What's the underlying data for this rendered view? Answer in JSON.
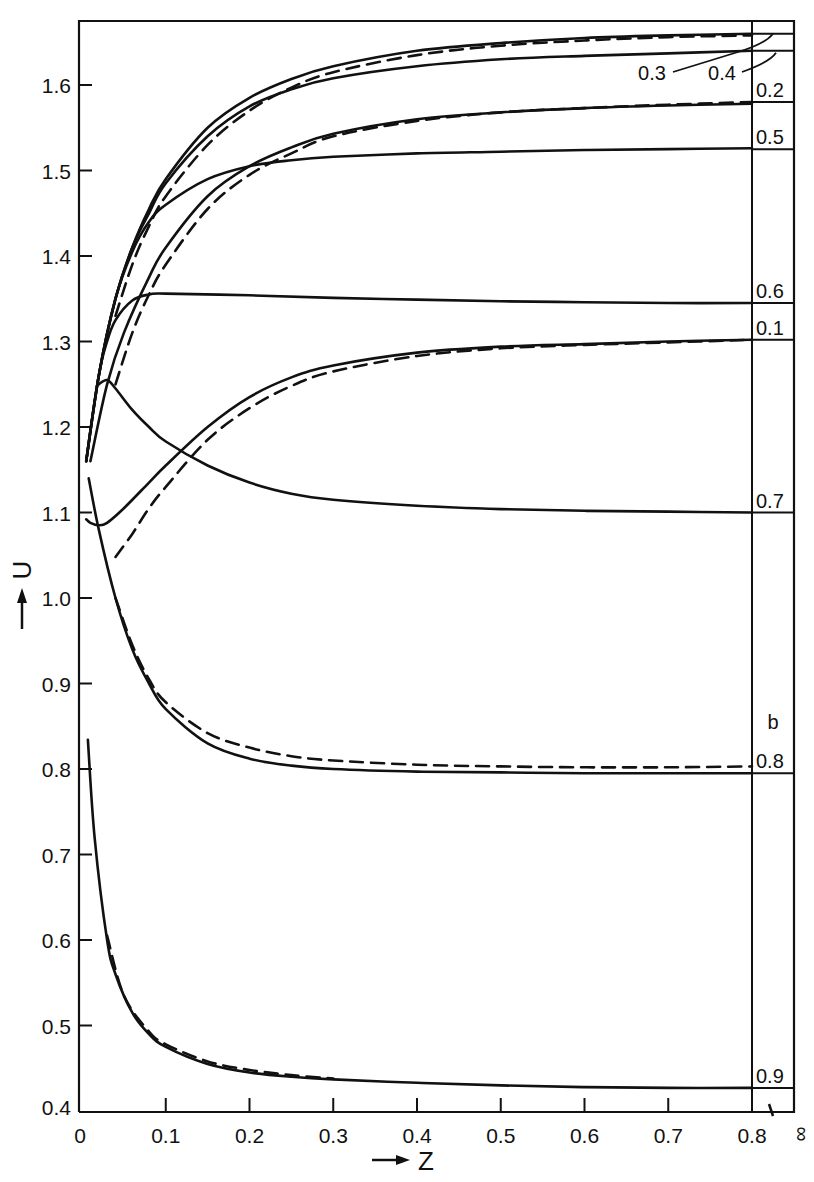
{
  "chart_data": {
    "type": "line",
    "title": "",
    "panel_label": "b",
    "xlabel": "Z",
    "ylabel": "U",
    "xlim": [
      0,
      0.8
    ],
    "ylim": [
      0.4,
      1.67
    ],
    "grid": false,
    "x_ticks": [
      "0",
      "0.1",
      "0.2",
      "0.3",
      "0.4",
      "0.5",
      "0.6",
      "0.7",
      "0.8"
    ],
    "x_extra_tick": "∞",
    "y_ticks": [
      "0.4",
      "0.5",
      "0.6",
      "0.7",
      "0.8",
      "0.9",
      "1.0",
      "1.1",
      "1.2",
      "1.3",
      "1.4",
      "1.5",
      "1.6"
    ],
    "legend": "Curves labeled by parameter at right margin; solid = exact, dashed = approximation; right strip gives asymptotic values at Z = ∞",
    "series": [
      {
        "name": "0.3",
        "style": "solid",
        "x": [
          0.005,
          0.02,
          0.04,
          0.06,
          0.08,
          0.1,
          0.15,
          0.2,
          0.25,
          0.3,
          0.4,
          0.5,
          0.6,
          0.7,
          0.8
        ],
        "y": [
          1.16,
          1.26,
          1.35,
          1.41,
          1.455,
          1.49,
          1.55,
          1.585,
          1.607,
          1.622,
          1.64,
          1.649,
          1.655,
          1.658,
          1.66
        ],
        "infinity_value": 1.66
      },
      {
        "name": "0.3",
        "style": "dashed",
        "x": [
          0.04,
          0.06,
          0.08,
          0.1,
          0.15,
          0.2,
          0.25,
          0.3,
          0.4,
          0.5,
          0.6,
          0.7,
          0.8
        ],
        "y": [
          1.33,
          1.39,
          1.435,
          1.47,
          1.53,
          1.57,
          1.597,
          1.615,
          1.635,
          1.646,
          1.652,
          1.656,
          1.658
        ]
      },
      {
        "name": "0.4",
        "style": "solid",
        "x": [
          0.005,
          0.02,
          0.04,
          0.06,
          0.08,
          0.1,
          0.15,
          0.2,
          0.25,
          0.3,
          0.4,
          0.5,
          0.6,
          0.7,
          0.8
        ],
        "y": [
          1.16,
          1.26,
          1.35,
          1.41,
          1.45,
          1.485,
          1.54,
          1.575,
          1.595,
          1.608,
          1.622,
          1.63,
          1.634,
          1.637,
          1.64
        ],
        "infinity_value": 1.64
      },
      {
        "name": "0.2",
        "style": "solid",
        "x": [
          0.01,
          0.03,
          0.05,
          0.08,
          0.1,
          0.15,
          0.2,
          0.25,
          0.3,
          0.4,
          0.5,
          0.6,
          0.7,
          0.8
        ],
        "y": [
          1.16,
          1.25,
          1.31,
          1.375,
          1.41,
          1.47,
          1.505,
          1.527,
          1.543,
          1.56,
          1.568,
          1.573,
          1.576,
          1.578
        ],
        "infinity_value": 1.58
      },
      {
        "name": "0.2",
        "style": "dashed",
        "x": [
          0.04,
          0.06,
          0.08,
          0.1,
          0.15,
          0.2,
          0.25,
          0.3,
          0.4,
          0.5,
          0.6,
          0.7,
          0.8
        ],
        "y": [
          1.25,
          1.31,
          1.355,
          1.39,
          1.455,
          1.495,
          1.52,
          1.54,
          1.558,
          1.568,
          1.573,
          1.577,
          1.58
        ]
      },
      {
        "name": "0.5",
        "style": "solid",
        "x": [
          0.005,
          0.02,
          0.04,
          0.06,
          0.08,
          0.1,
          0.15,
          0.2,
          0.25,
          0.3,
          0.4,
          0.5,
          0.6,
          0.7,
          0.8
        ],
        "y": [
          1.16,
          1.26,
          1.35,
          1.405,
          1.44,
          1.46,
          1.49,
          1.505,
          1.512,
          1.516,
          1.52,
          1.522,
          1.524,
          1.525,
          1.526
        ],
        "infinity_value": 1.525
      },
      {
        "name": "0.6",
        "style": "solid",
        "x": [
          0.005,
          0.02,
          0.03,
          0.04,
          0.06,
          0.08,
          0.1,
          0.2,
          0.3,
          0.4,
          0.5,
          0.6,
          0.7,
          0.8
        ],
        "y": [
          1.16,
          1.26,
          1.3,
          1.325,
          1.348,
          1.355,
          1.356,
          1.354,
          1.351,
          1.349,
          1.347,
          1.346,
          1.345,
          1.345
        ],
        "infinity_value": 1.345
      },
      {
        "name": "0.1",
        "style": "solid",
        "x": [
          0.005,
          0.01,
          0.02,
          0.03,
          0.05,
          0.08,
          0.1,
          0.15,
          0.2,
          0.25,
          0.3,
          0.4,
          0.5,
          0.6,
          0.7,
          0.8
        ],
        "y": [
          1.092,
          1.088,
          1.085,
          1.088,
          1.105,
          1.135,
          1.155,
          1.2,
          1.235,
          1.258,
          1.272,
          1.287,
          1.294,
          1.297,
          1.3,
          1.302
        ],
        "infinity_value": 1.302
      },
      {
        "name": "0.1",
        "style": "dashed",
        "x": [
          0.04,
          0.06,
          0.08,
          0.1,
          0.15,
          0.2,
          0.25,
          0.3,
          0.4,
          0.5,
          0.6,
          0.7,
          0.8
        ],
        "y": [
          1.048,
          1.075,
          1.105,
          1.13,
          1.185,
          1.222,
          1.248,
          1.265,
          1.283,
          1.292,
          1.296,
          1.299,
          1.302
        ]
      },
      {
        "name": "0.7",
        "style": "solid",
        "x": [
          0.02,
          0.03,
          0.04,
          0.06,
          0.08,
          0.1,
          0.15,
          0.2,
          0.25,
          0.3,
          0.4,
          0.5,
          0.6,
          0.7,
          0.8
        ],
        "y": [
          1.25,
          1.255,
          1.245,
          1.22,
          1.2,
          1.183,
          1.155,
          1.135,
          1.122,
          1.115,
          1.108,
          1.104,
          1.102,
          1.101,
          1.1
        ],
        "infinity_value": 1.1
      },
      {
        "name": "0.8",
        "style": "solid",
        "x": [
          0.008,
          0.02,
          0.04,
          0.06,
          0.08,
          0.1,
          0.15,
          0.2,
          0.25,
          0.3,
          0.4,
          0.5,
          0.6,
          0.7,
          0.8
        ],
        "y": [
          1.14,
          1.08,
          1.0,
          0.94,
          0.9,
          0.87,
          0.83,
          0.812,
          0.804,
          0.8,
          0.797,
          0.796,
          0.795,
          0.795,
          0.795
        ],
        "infinity_value": 0.795
      },
      {
        "name": "0.8",
        "style": "dashed",
        "x": [
          0.04,
          0.06,
          0.08,
          0.1,
          0.15,
          0.2,
          0.25,
          0.3,
          0.4,
          0.5,
          0.6,
          0.7,
          0.8
        ],
        "y": [
          1.0,
          0.945,
          0.905,
          0.878,
          0.842,
          0.825,
          0.815,
          0.81,
          0.805,
          0.803,
          0.802,
          0.802,
          0.803
        ]
      },
      {
        "name": "0.9",
        "style": "solid",
        "x": [
          0.007,
          0.015,
          0.03,
          0.04,
          0.06,
          0.08,
          0.1,
          0.15,
          0.2,
          0.25,
          0.3,
          0.4,
          0.5,
          0.6,
          0.7,
          0.8
        ],
        "y": [
          0.834,
          0.72,
          0.6,
          0.56,
          0.515,
          0.49,
          0.475,
          0.455,
          0.445,
          0.44,
          0.437,
          0.433,
          0.43,
          0.428,
          0.427,
          0.427
        ],
        "infinity_value": 0.427
      },
      {
        "name": "0.9",
        "style": "dashed",
        "x": [
          0.03,
          0.05,
          0.08,
          0.1,
          0.15,
          0.2,
          0.25,
          0.3
        ],
        "y": [
          0.605,
          0.535,
          0.493,
          0.478,
          0.458,
          0.448,
          0.442,
          0.438
        ]
      }
    ],
    "right_strip_labels": [
      {
        "label": "0.3",
        "value": 1.66,
        "position": "callout"
      },
      {
        "label": "0.4",
        "value": 1.64,
        "position": "callout"
      },
      {
        "label": "0.2",
        "value": 1.58
      },
      {
        "label": "0.5",
        "value": 1.525
      },
      {
        "label": "0.6",
        "value": 1.345
      },
      {
        "label": "0.1",
        "value": 1.302
      },
      {
        "label": "0.7",
        "value": 1.1
      },
      {
        "label": "0.8",
        "value": 0.795
      },
      {
        "label": "0.9",
        "value": 0.427
      }
    ]
  }
}
